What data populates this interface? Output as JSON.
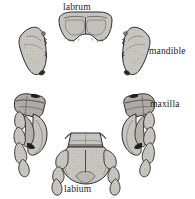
{
  "figure": {
    "kind": "scientific-illustration",
    "background_color": "#ffffff",
    "line_color": "#2b2b2b",
    "fill_light": "#c9c7c2",
    "fill_mid": "#b4b2ad",
    "fill_dark": "#8d8b86",
    "fill_darkest": "#1f1f1f"
  },
  "labels": {
    "labrum": "labrum",
    "mandible": "mandible",
    "maxilla": "maxilla",
    "labium": "labium"
  },
  "parts": [
    {
      "id": "labrum",
      "name": "labrum",
      "position": "top-center",
      "label": "labrum"
    },
    {
      "id": "mandible-left",
      "name": "left mandible",
      "position": "upper-left",
      "label": ""
    },
    {
      "id": "mandible-right",
      "name": "right mandible",
      "position": "upper-right",
      "label": "mandible"
    },
    {
      "id": "maxilla-left",
      "name": "left maxilla",
      "position": "lower-left",
      "label": ""
    },
    {
      "id": "maxilla-right",
      "name": "right maxilla",
      "position": "lower-right",
      "label": "maxilla"
    },
    {
      "id": "labium",
      "name": "labium",
      "position": "bottom-center",
      "label": "labium"
    }
  ]
}
